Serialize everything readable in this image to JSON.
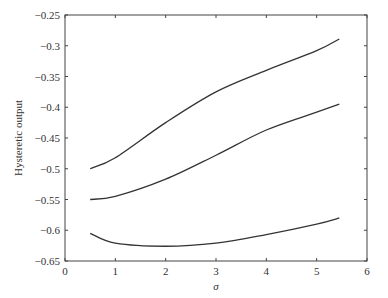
{
  "chart_data": {
    "type": "line",
    "title": "",
    "xlabel": "σ",
    "ylabel": "Hysteretic output",
    "xlim": [
      0,
      6
    ],
    "ylim": [
      -0.65,
      -0.25
    ],
    "xticks": [
      0,
      1,
      2,
      3,
      4,
      5,
      6
    ],
    "xtick_labels": [
      "0",
      "1",
      "2",
      "3",
      "4",
      "5",
      "6"
    ],
    "yticks": [
      -0.25,
      -0.3,
      -0.35,
      -0.4,
      -0.45,
      -0.5,
      -0.55,
      -0.6,
      -0.65
    ],
    "ytick_labels": [
      "−0.25",
      "−0.3",
      "−0.35",
      "−0.4",
      "−0.45",
      "−0.5",
      "−0.55",
      "−0.6",
      "−0.65"
    ],
    "grid": false,
    "legend": null,
    "line_color": "#333333",
    "x": [
      0.5,
      1,
      2,
      3,
      4,
      5,
      5.45
    ],
    "series": [
      {
        "name": "upper curve",
        "values": [
          -0.5,
          -0.482,
          -0.425,
          -0.375,
          -0.34,
          -0.308,
          -0.289
        ]
      },
      {
        "name": "middle curve",
        "values": [
          -0.55,
          -0.545,
          -0.517,
          -0.478,
          -0.437,
          -0.408,
          -0.395
        ]
      },
      {
        "name": "lower curve",
        "values": [
          -0.605,
          -0.621,
          -0.626,
          -0.621,
          -0.607,
          -0.59,
          -0.58
        ]
      }
    ]
  }
}
